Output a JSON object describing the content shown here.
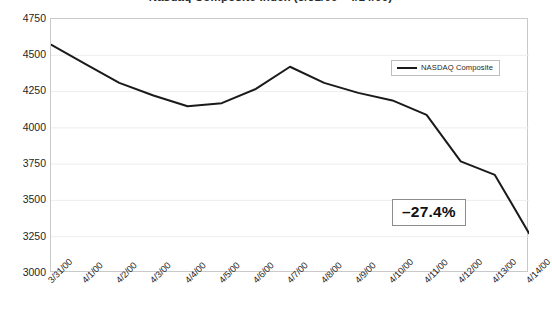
{
  "chart_data": {
    "type": "line",
    "title": "Nasdaq Composite Index (3/31/00 - 4/14/00)",
    "xlabel": "",
    "ylabel": "",
    "ylim": [
      3000,
      4750
    ],
    "yticks": [
      4750,
      4500,
      4250,
      4000,
      3750,
      3500,
      3250,
      3000
    ],
    "grid": true,
    "grid_orientation": "horizontal",
    "legend": {
      "position": "top-right-inside",
      "entries": [
        "NASDAQ Composite"
      ]
    },
    "categories": [
      "3/31/00",
      "4/1/00",
      "4/2/00",
      "4/3/00",
      "4/4/00",
      "4/5/00",
      "4/6/00",
      "4/7/00",
      "4/8/00",
      "4/9/00",
      "4/10/00",
      "4/11/00",
      "4/12/00",
      "4/13/00",
      "4/14/00"
    ],
    "series": [
      {
        "name": "NASDAQ Composite",
        "color": "#1a1a1a",
        "values": [
          4573,
          4440,
          4310,
          4223,
          4149,
          4170,
          4268,
          4421,
          4310,
          4241,
          4189,
          4089,
          3769,
          3676,
          3274
        ]
      }
    ],
    "annotations": [
      {
        "name": "percent-change-callout",
        "text": "–27.4%",
        "boxed": true
      }
    ]
  }
}
